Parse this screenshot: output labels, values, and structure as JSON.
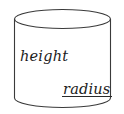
{
  "figure": {
    "kind": "cylinder-diagram",
    "background_color": "#ffffff",
    "stroke_color": "#3a3a3a",
    "text_color": "#1c1c1c",
    "labels": {
      "height": "height",
      "radius": "radius"
    },
    "geometry": {
      "left_edge_x": 14,
      "right_edge_x": 111,
      "top_ellipse_center_y": 19,
      "top_ellipse_rx": 48.5,
      "top_ellipse_ry": 9.5,
      "bottom_arc_center_y": 98,
      "bottom_arc_rx": 48.5,
      "bottom_arc_ry": 9.5,
      "radius_segment_x1": 62,
      "radius_segment_x2": 112,
      "radius_segment_y": 96
    }
  }
}
